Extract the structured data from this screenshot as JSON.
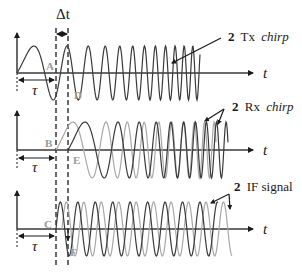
{
  "figure": {
    "delta_t_label": "Δt",
    "tau_label": "τ",
    "time_axis_label": "t",
    "colors": {
      "dark": "#3a3a3a",
      "light": "#a8a8a8",
      "point_label": "#9a9a9a",
      "text": "#1a1a1a"
    }
  },
  "panels": [
    {
      "id": "tx",
      "points": [
        "A",
        "D"
      ],
      "annotation": {
        "number": "2",
        "text": "Tx",
        "italic": "chirp"
      }
    },
    {
      "id": "rx",
      "points": [
        "B",
        "E"
      ],
      "annotation": {
        "number": "2",
        "text": "Rx",
        "italic": "chirp"
      }
    },
    {
      "id": "if",
      "points": [
        "C",
        "F"
      ],
      "annotation": {
        "number": "2",
        "text": "IF signal",
        "italic": ""
      }
    }
  ]
}
